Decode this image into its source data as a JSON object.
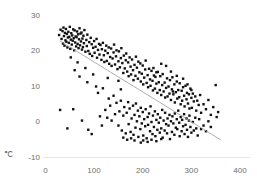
{
  "chart_data": {
    "type": "scatter",
    "title": "",
    "subtitle": "",
    "xlabel": "",
    "ylabel": "℃",
    "unit_label": "℃",
    "xlim": [
      0,
      400
    ],
    "ylim": [
      -10,
      30
    ],
    "x_ticks": [
      0,
      100,
      200,
      300,
      400
    ],
    "y_ticks": [
      -10,
      0,
      10,
      20,
      30
    ],
    "x_tick_labels": [
      "0",
      "100",
      "200",
      "300",
      "400"
    ],
    "y_tick_labels": [
      "-10",
      "0",
      "10",
      "20",
      "30"
    ],
    "grid": false,
    "baseline_only": true,
    "legend": null,
    "legend_position": "none",
    "marker": {
      "shape": "square",
      "size_px": 2.4,
      "color": "#111111"
    },
    "trendline": {
      "type": "linear",
      "color": "#9a9a9a",
      "width_px": 0.8,
      "x_start": 30,
      "y_start": 22.8,
      "x_end": 360,
      "y_end": -5.0,
      "slope": -0.0842,
      "intercept": 25.33
    },
    "n_points": 330,
    "points": [
      [
        28,
        24.5
      ],
      [
        31,
        26.0
      ],
      [
        33,
        23.4
      ],
      [
        35,
        25.6
      ],
      [
        36,
        22.1
      ],
      [
        37,
        26.6
      ],
      [
        38,
        24.2
      ],
      [
        39,
        21.5
      ],
      [
        40,
        25.1
      ],
      [
        41,
        23.0
      ],
      [
        42,
        26.2
      ],
      [
        43,
        22.6
      ],
      [
        44,
        24.8
      ],
      [
        45,
        21.0
      ],
      [
        46,
        23.8
      ],
      [
        47,
        25.4
      ],
      [
        48,
        22.3
      ],
      [
        49,
        24.0
      ],
      [
        50,
        26.8
      ],
      [
        51,
        20.6
      ],
      [
        52,
        23.2
      ],
      [
        53,
        25.0
      ],
      [
        54,
        21.8
      ],
      [
        55,
        24.4
      ],
      [
        56,
        22.9
      ],
      [
        57,
        26.1
      ],
      [
        58,
        23.6
      ],
      [
        59,
        20.2
      ],
      [
        60,
        25.8
      ],
      [
        61,
        22.4
      ],
      [
        62,
        24.1
      ],
      [
        63,
        21.3
      ],
      [
        64,
        23.9
      ],
      [
        65,
        25.5
      ],
      [
        66,
        22.0
      ],
      [
        67,
        24.7
      ],
      [
        68,
        20.8
      ],
      [
        69,
        23.3
      ],
      [
        70,
        26.4
      ],
      [
        71,
        21.6
      ],
      [
        72,
        24.9
      ],
      [
        73,
        22.7
      ],
      [
        74,
        25.2
      ],
      [
        75,
        20.4
      ],
      [
        76,
        23.5
      ],
      [
        77,
        21.1
      ],
      [
        78,
        24.3
      ],
      [
        79,
        22.2
      ],
      [
        80,
        25.9
      ],
      [
        82,
        19.8
      ],
      [
        84,
        23.1
      ],
      [
        85,
        21.4
      ],
      [
        86,
        24.6
      ],
      [
        88,
        20.0
      ],
      [
        90,
        22.5
      ],
      [
        91,
        19.2
      ],
      [
        93,
        23.7
      ],
      [
        95,
        21.9
      ],
      [
        96,
        18.6
      ],
      [
        98,
        20.9
      ],
      [
        100,
        22.8
      ],
      [
        101,
        19.5
      ],
      [
        103,
        21.2
      ],
      [
        105,
        23.4
      ],
      [
        106,
        18.1
      ],
      [
        108,
        20.3
      ],
      [
        110,
        22.0
      ],
      [
        111,
        19.0
      ],
      [
        113,
        21.7
      ],
      [
        115,
        17.5
      ],
      [
        116,
        20.5
      ],
      [
        118,
        22.3
      ],
      [
        120,
        18.8
      ],
      [
        121,
        16.9
      ],
      [
        123,
        20.1
      ],
      [
        125,
        21.5
      ],
      [
        126,
        17.2
      ],
      [
        128,
        19.4
      ],
      [
        130,
        21.0
      ],
      [
        131,
        16.4
      ],
      [
        133,
        18.3
      ],
      [
        135,
        20.7
      ],
      [
        136,
        15.8
      ],
      [
        138,
        17.9
      ],
      [
        140,
        19.6
      ],
      [
        141,
        21.8
      ],
      [
        143,
        16.2
      ],
      [
        145,
        18.5
      ],
      [
        146,
        20.2
      ],
      [
        148,
        14.9
      ],
      [
        150,
        17.1
      ],
      [
        151,
        19.9
      ],
      [
        153,
        15.4
      ],
      [
        155,
        18.0
      ],
      [
        156,
        20.8
      ],
      [
        158,
        16.6
      ],
      [
        160,
        13.8
      ],
      [
        161,
        18.7
      ],
      [
        163,
        15.1
      ],
      [
        165,
        17.4
      ],
      [
        166,
        19.3
      ],
      [
        168,
        14.2
      ],
      [
        170,
        16.8
      ],
      [
        171,
        12.9
      ],
      [
        173,
        18.2
      ],
      [
        175,
        15.6
      ],
      [
        176,
        13.4
      ],
      [
        178,
        17.6
      ],
      [
        180,
        14.6
      ],
      [
        181,
        11.8
      ],
      [
        183,
        16.1
      ],
      [
        185,
        13.0
      ],
      [
        186,
        18.4
      ],
      [
        188,
        15.3
      ],
      [
        190,
        12.2
      ],
      [
        191,
        17.0
      ],
      [
        193,
        14.0
      ],
      [
        195,
        16.5
      ],
      [
        196,
        11.4
      ],
      [
        198,
        13.6
      ],
      [
        200,
        15.9
      ],
      [
        201,
        10.6
      ],
      [
        203,
        12.5
      ],
      [
        205,
        14.8
      ],
      [
        206,
        17.3
      ],
      [
        208,
        11.0
      ],
      [
        210,
        13.2
      ],
      [
        211,
        9.8
      ],
      [
        213,
        15.0
      ],
      [
        215,
        12.0
      ],
      [
        216,
        10.2
      ],
      [
        218,
        14.4
      ],
      [
        220,
        11.6
      ],
      [
        221,
        8.9
      ],
      [
        223,
        13.1
      ],
      [
        225,
        9.4
      ],
      [
        226,
        12.7
      ],
      [
        228,
        10.8
      ],
      [
        230,
        8.2
      ],
      [
        231,
        14.1
      ],
      [
        233,
        11.2
      ],
      [
        235,
        9.0
      ],
      [
        236,
        12.9
      ],
      [
        238,
        7.6
      ],
      [
        240,
        10.4
      ],
      [
        241,
        13.5
      ],
      [
        243,
        8.6
      ],
      [
        245,
        11.1
      ],
      [
        246,
        6.9
      ],
      [
        248,
        9.6
      ],
      [
        250,
        12.3
      ],
      [
        251,
        7.2
      ],
      [
        253,
        10.0
      ],
      [
        255,
        8.0
      ],
      [
        256,
        11.8
      ],
      [
        258,
        6.2
      ],
      [
        260,
        9.2
      ],
      [
        261,
        12.6
      ],
      [
        263,
        7.8
      ],
      [
        265,
        10.6
      ],
      [
        266,
        5.5
      ],
      [
        268,
        8.4
      ],
      [
        270,
        11.4
      ],
      [
        271,
        6.6
      ],
      [
        273,
        9.0
      ],
      [
        275,
        7.0
      ],
      [
        276,
        10.9
      ],
      [
        278,
        5.0
      ],
      [
        280,
        8.8
      ],
      [
        281,
        6.0
      ],
      [
        283,
        9.8
      ],
      [
        285,
        7.4
      ],
      [
        286,
        4.4
      ],
      [
        288,
        10.2
      ],
      [
        290,
        6.4
      ],
      [
        291,
        8.2
      ],
      [
        293,
        5.2
      ],
      [
        295,
        7.8
      ],
      [
        296,
        3.8
      ],
      [
        298,
        9.4
      ],
      [
        300,
        6.8
      ],
      [
        301,
        4.0
      ],
      [
        303,
        8.0
      ],
      [
        305,
        5.8
      ],
      [
        308,
        7.2
      ],
      [
        310,
        3.2
      ],
      [
        312,
        6.0
      ],
      [
        315,
        4.8
      ],
      [
        318,
        7.6
      ],
      [
        320,
        2.6
      ],
      [
        325,
        5.0
      ],
      [
        330,
        3.6
      ],
      [
        335,
        6.2
      ],
      [
        340,
        2.0
      ],
      [
        345,
        4.2
      ],
      [
        350,
        10.4
      ],
      [
        352,
        1.4
      ],
      [
        355,
        2.8
      ],
      [
        118,
        9.5
      ],
      [
        123,
        3.4
      ],
      [
        127,
        1.2
      ],
      [
        130,
        6.6
      ],
      [
        133,
        4.6
      ],
      [
        136,
        0.4
      ],
      [
        140,
        7.4
      ],
      [
        143,
        2.2
      ],
      [
        146,
        5.4
      ],
      [
        150,
        -1.0
      ],
      [
        152,
        3.0
      ],
      [
        155,
        6.0
      ],
      [
        157,
        -2.4
      ],
      [
        160,
        1.8
      ],
      [
        162,
        4.2
      ],
      [
        165,
        -3.2
      ],
      [
        167,
        2.6
      ],
      [
        170,
        5.6
      ],
      [
        171,
        -0.6
      ],
      [
        173,
        3.8
      ],
      [
        175,
        -2.8
      ],
      [
        177,
        1.0
      ],
      [
        180,
        4.6
      ],
      [
        181,
        -3.6
      ],
      [
        183,
        2.0
      ],
      [
        185,
        -1.6
      ],
      [
        186,
        5.2
      ],
      [
        188,
        0.2
      ],
      [
        190,
        3.2
      ],
      [
        191,
        -4.2
      ],
      [
        193,
        1.6
      ],
      [
        195,
        -2.0
      ],
      [
        196,
        4.0
      ],
      [
        198,
        -0.4
      ],
      [
        200,
        2.8
      ],
      [
        201,
        -3.8
      ],
      [
        203,
        0.8
      ],
      [
        205,
        -1.2
      ],
      [
        206,
        3.6
      ],
      [
        208,
        -4.6
      ],
      [
        210,
        1.4
      ],
      [
        211,
        -0.8
      ],
      [
        213,
        2.4
      ],
      [
        215,
        -2.6
      ],
      [
        216,
        4.4
      ],
      [
        218,
        0.0
      ],
      [
        220,
        -3.4
      ],
      [
        221,
        1.8
      ],
      [
        223,
        -1.4
      ],
      [
        225,
        3.0
      ],
      [
        226,
        -4.0
      ],
      [
        228,
        0.6
      ],
      [
        230,
        -2.2
      ],
      [
        231,
        2.2
      ],
      [
        233,
        -0.2
      ],
      [
        235,
        -3.0
      ],
      [
        236,
        1.2
      ],
      [
        238,
        -1.8
      ],
      [
        240,
        3.4
      ],
      [
        241,
        -4.4
      ],
      [
        243,
        0.4
      ],
      [
        245,
        -2.4
      ],
      [
        246,
        2.6
      ],
      [
        248,
        -0.6
      ],
      [
        250,
        -3.2
      ],
      [
        251,
        1.0
      ],
      [
        253,
        -1.0
      ],
      [
        255,
        2.0
      ],
      [
        256,
        -4.8
      ],
      [
        258,
        0.2
      ],
      [
        260,
        -2.8
      ],
      [
        261,
        1.6
      ],
      [
        263,
        -0.4
      ],
      [
        265,
        -3.6
      ],
      [
        266,
        2.4
      ],
      [
        268,
        -1.6
      ],
      [
        270,
        0.8
      ],
      [
        271,
        -2.0
      ],
      [
        273,
        3.2
      ],
      [
        275,
        -0.2
      ],
      [
        276,
        -4.0
      ],
      [
        278,
        1.4
      ],
      [
        280,
        -2.6
      ],
      [
        281,
        0.6
      ],
      [
        283,
        -1.2
      ],
      [
        285,
        2.2
      ],
      [
        286,
        -3.4
      ],
      [
        288,
        -0.8
      ],
      [
        290,
        1.0
      ],
      [
        291,
        -2.2
      ],
      [
        293,
        -4.2
      ],
      [
        295,
        0.4
      ],
      [
        296,
        1.8
      ],
      [
        298,
        -1.4
      ],
      [
        300,
        -3.0
      ],
      [
        303,
        0.0
      ],
      [
        305,
        -2.4
      ],
      [
        308,
        1.2
      ],
      [
        310,
        -1.8
      ],
      [
        313,
        -3.8
      ],
      [
        316,
        0.8
      ],
      [
        320,
        -2.0
      ],
      [
        325,
        -1.0
      ],
      [
        330,
        -2.6
      ],
      [
        335,
        0.2
      ],
      [
        340,
        -1.4
      ],
      [
        196,
        -5.8
      ],
      [
        201,
        -5.2
      ],
      [
        210,
        -5.6
      ],
      [
        218,
        -5.0
      ],
      [
        228,
        -5.4
      ],
      [
        238,
        -4.8
      ],
      [
        160,
        -4.4
      ],
      [
        168,
        -5.0
      ],
      [
        176,
        -4.6
      ],
      [
        183,
        -5.2
      ],
      [
        30,
        3.4
      ],
      [
        57,
        3.6
      ],
      [
        45,
        -1.8
      ],
      [
        75,
        0.4
      ],
      [
        88,
        -2.2
      ],
      [
        95,
        -3.4
      ],
      [
        108,
        8.2
      ],
      [
        112,
        1.6
      ],
      [
        116,
        -1.0
      ],
      [
        150,
        11.6
      ],
      [
        155,
        9.2
      ],
      [
        128,
        12.4
      ],
      [
        60,
        14.6
      ],
      [
        66,
        16.8
      ],
      [
        52,
        18.2
      ],
      [
        70,
        12.8
      ],
      [
        82,
        15.2
      ],
      [
        98,
        13.4
      ],
      [
        86,
        11.2
      ],
      [
        104,
        10.0
      ],
      [
        258,
        14.2
      ],
      [
        270,
        13.0
      ],
      [
        248,
        15.8
      ],
      [
        292,
        10.6
      ],
      [
        300,
        9.0
      ],
      [
        283,
        12.2
      ],
      [
        238,
        16.4
      ],
      [
        228,
        14.0
      ],
      [
        222,
        15.2
      ],
      [
        262,
        8.6
      ]
    ]
  },
  "axis_style": {
    "baseline_color": "#e6e6e6",
    "tick_label_color": "#6d6d6d",
    "background": "#ffffff"
  }
}
